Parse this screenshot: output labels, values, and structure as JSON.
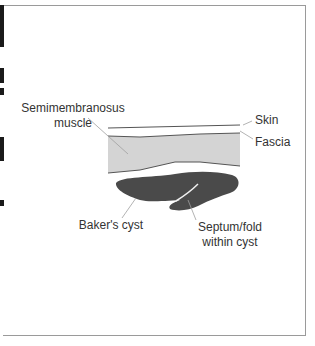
{
  "figure": {
    "labels": {
      "muscle": [
        "Semimembranosus",
        "muscle"
      ],
      "skin": "Skin",
      "fascia": "Fascia",
      "cyst": "Baker's cyst",
      "septum": [
        "Septum/fold",
        "within cyst"
      ]
    },
    "colors": {
      "muscle_fill": "#d4d4d4",
      "cyst_fill": "#4a4a4a",
      "outline": "#555555",
      "leader": "#a0a0a0",
      "text": "#333333"
    }
  }
}
